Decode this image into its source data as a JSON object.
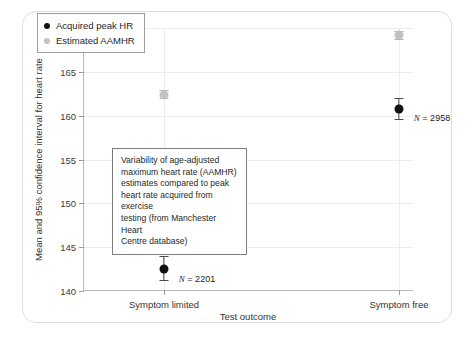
{
  "chart_data": {
    "type": "scatter",
    "title": "",
    "xlabel": "Test outcome",
    "ylabel": "Mean and 95% confidence interval for heart rate",
    "ylim": [
      140,
      170
    ],
    "yticks": [
      140,
      145,
      150,
      155,
      160,
      165,
      170
    ],
    "categories": [
      "Symptom limited",
      "Symptom free"
    ],
    "grid": true,
    "legend_position": "top-left",
    "series": [
      {
        "name": "Acquired peak HR",
        "color": "#111111",
        "values": [
          142.5,
          160.8
        ],
        "ci_low": [
          141.2,
          159.6
        ],
        "ci_high": [
          144.0,
          162.0
        ]
      },
      {
        "name": "Estimated AAMHR",
        "color": "#c2c2c2",
        "values": [
          162.4,
          169.2
        ],
        "ci_low": [
          162.0,
          168.7
        ],
        "ci_high": [
          162.9,
          169.7
        ]
      }
    ],
    "point_annotations": [
      {
        "category": "Symptom limited",
        "prefix": "N",
        "text": " = 2201"
      },
      {
        "category": "Symptom free",
        "prefix": "N",
        "text": " = 2958"
      }
    ],
    "annotation_box": {
      "lines": [
        "Variability of age-adjusted",
        "maximum heart rate (AAMHR)",
        "estimates compared to peak",
        "heart rate acquired from exercise",
        "testing (from Manchester Heart",
        "Centre database)"
      ]
    }
  },
  "axis": {
    "y_tick_labels": [
      "170",
      "165",
      "160",
      "155",
      "150",
      "145",
      "140"
    ],
    "x_tick_labels": [
      "Symptom limited",
      "Symptom free"
    ],
    "y_title": "Mean and 95% confidence interval for heart rate",
    "x_title": "Test outcome"
  },
  "legend": {
    "items": [
      {
        "label": "Acquired peak HR"
      },
      {
        "label": "Estimated AAMHR"
      }
    ]
  },
  "n_labels": [
    {
      "text": "= 2201",
      "italic": "N"
    },
    {
      "text": "= 2958",
      "italic": "N"
    }
  ]
}
